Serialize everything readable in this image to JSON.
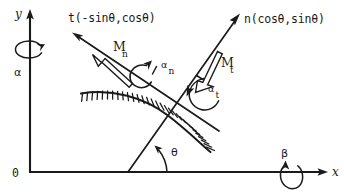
{
  "figure": {
    "background_color": "#ffffff",
    "ink_color": "#1a1a1a",
    "width": 344,
    "height": 196
  },
  "axes": {
    "x_label": "x",
    "y_label": "y",
    "origin_label": "0"
  },
  "vectors": {
    "tangent": {
      "name": "tangent-vector",
      "label": "t(-sinθ,cosθ)",
      "symbol": "t",
      "components": "(-sinθ, cosθ)"
    },
    "normal": {
      "name": "normal-vector",
      "label": "n(cosθ,sinθ)",
      "symbol": "n",
      "components": "(cosθ, sinθ)"
    }
  },
  "moments": {
    "normal_moment": {
      "base": "M",
      "subscript": "n",
      "label": "M_n"
    },
    "tangential_moment": {
      "base": "M",
      "subscript": "t",
      "label": "M_t"
    }
  },
  "angles": {
    "alpha_n": {
      "base": "α",
      "subscript": "n",
      "label": "α_n"
    },
    "alpha_t": {
      "base": "α",
      "subscript": "t",
      "label": "α_t"
    },
    "theta": {
      "label": "θ",
      "description": "angle of normal vector from x-axis"
    }
  },
  "rotations": {
    "about_y": {
      "label": "α",
      "axis": "y",
      "description": "rotation about the y-axis"
    },
    "about_x": {
      "label": "β",
      "axis": "x",
      "description": "rotation about the x-axis"
    }
  },
  "surface": {
    "name": "hatched-contact-surface",
    "description": "hatched curved boundary representing the contact surface"
  }
}
